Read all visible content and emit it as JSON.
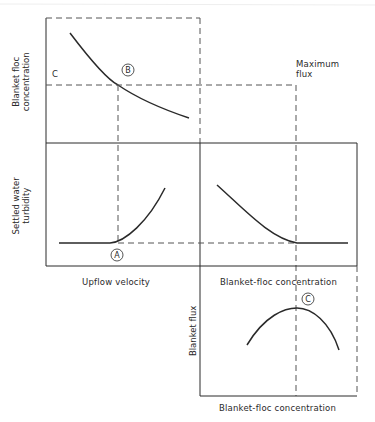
{
  "diagram": {
    "colors": {
      "line": "#2a2a2a",
      "dashed": "#555555",
      "background": "#ffffff"
    },
    "panels": {
      "top_left": {
        "y_label": [
          "Blanket floc",
          "concentration"
        ],
        "y_value_label": "C",
        "marker": "B",
        "curve": "decreasing"
      },
      "middle_left": {
        "y_label": [
          "Settled water",
          "turbidity"
        ],
        "x_label": "Upflow velocity",
        "marker": "A",
        "curve": "flat then rising"
      },
      "middle_right": {
        "x_label": "Blanket-floc concentration",
        "curve": "decreasing then flat"
      },
      "bottom_right": {
        "y_label": "Blanket flux",
        "x_label": "Blanket-floc concentration",
        "marker": "C",
        "curve": "parabolic peak"
      }
    },
    "annotation": {
      "max_flux": [
        "Maximum",
        "flux"
      ]
    }
  }
}
